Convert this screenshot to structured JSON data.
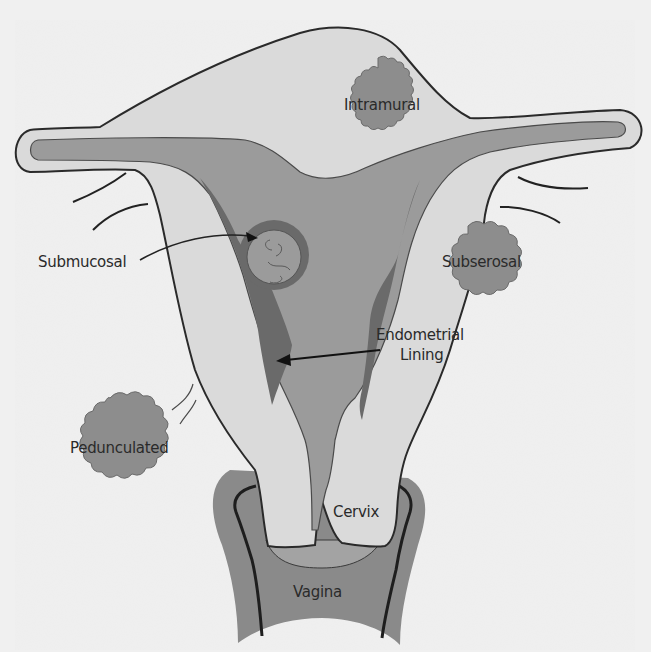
{
  "colors": {
    "page_background": "#f0f0f0",
    "uterine_wall": "#dadada",
    "cavity": "#9b9b9b",
    "endometrial_lining": "#6a6a6a",
    "fibroid": "#8d8d8d",
    "vagina": "#8a8a8a",
    "outline": "#2a2a2a"
  },
  "labels": {
    "intramural": "Intramural",
    "submucosal": "Submucosal",
    "subserosal": "Subserosal",
    "endometrial_line1": "Endometrial",
    "endometrial_line2": "Lining",
    "pedunculated": "Pedunculated",
    "cervix": "Cervix",
    "vagina": "Vagina"
  }
}
